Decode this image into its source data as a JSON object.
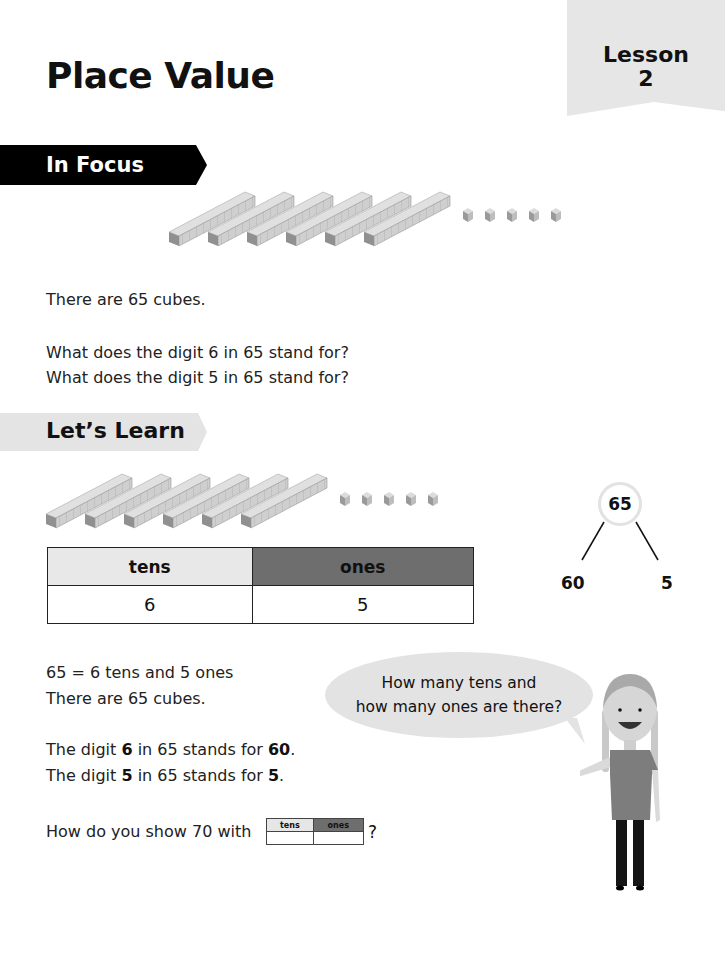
{
  "header": {
    "title": "Place Value",
    "lesson_label": "Lesson",
    "lesson_number": "2"
  },
  "in_focus": {
    "banner": "In Focus",
    "blocks": {
      "tens_rods": 6,
      "ones_cubes": 5
    },
    "statement": "There are 65 cubes.",
    "questions": [
      "What does the digit 6 in 65 stand for?",
      "What does the digit 5 in 65 stand for?"
    ]
  },
  "lets_learn": {
    "banner": "Let’s Learn",
    "blocks": {
      "tens_rods": 6,
      "ones_cubes": 5
    },
    "place_value_table": {
      "headers": [
        "tens",
        "ones"
      ],
      "values": [
        "6",
        "5"
      ]
    },
    "number_bond": {
      "whole": "65",
      "parts": [
        "60",
        "5"
      ]
    },
    "explanation": [
      "65 = 6 tens and 5 ones",
      "There are 65 cubes."
    ],
    "digit_meanings": [
      {
        "prefix": "The digit ",
        "digit": "6",
        "middle": " in 65 stands for ",
        "value": "60",
        "suffix": "."
      },
      {
        "prefix": "The digit ",
        "digit": "5",
        "middle": " in 65 stands for ",
        "value": "5",
        "suffix": "."
      }
    ],
    "speech_bubble": [
      "How many tens and",
      "how many ones are there?"
    ],
    "question": {
      "text": "How do you show 70 with",
      "mini_table_headers": [
        "tens",
        "ones"
      ],
      "suffix": "?"
    }
  },
  "colors": {
    "banner_focus": "#000000",
    "banner_learn": "#e4e4e4",
    "lesson_tab": "#e6e6e6",
    "tens_header": "#e8e8e8",
    "ones_header": "#6e6e6e",
    "bubble": "#e3e3e3"
  }
}
